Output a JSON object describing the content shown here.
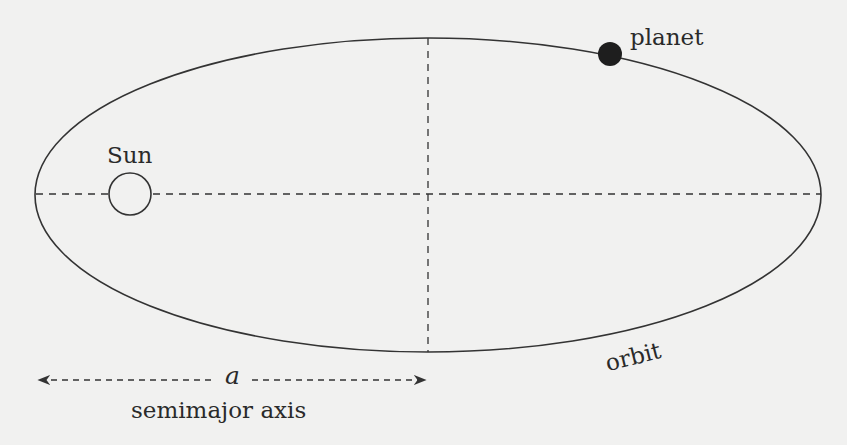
{
  "diagram": {
    "labels": {
      "planet": "planet",
      "sun": "Sun",
      "orbit": "orbit",
      "a_symbol": "a",
      "semimajor": "semimajor axis"
    },
    "colors": {
      "background": "#f1f1f0",
      "line": "#333333",
      "planet_fill": "#1e1e1e"
    }
  }
}
